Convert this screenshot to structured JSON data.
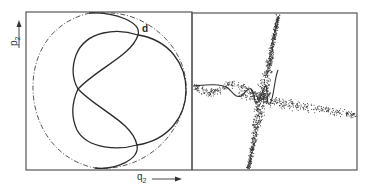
{
  "figure": {
    "left_panel": {
      "y_axis_label": "p",
      "y_axis_sub": "2",
      "x_axis_label": "q",
      "x_axis_sub": "2",
      "point_label": "d",
      "frame": {
        "x": 26,
        "y": 12,
        "w": 166,
        "h": 158
      },
      "boundary_circle": {
        "cx": 112,
        "cy": 89,
        "r": 77,
        "style": "dash-dot"
      },
      "curve_style": "solid"
    },
    "right_panel": {
      "frame": {
        "x": 192,
        "y": 13,
        "w": 165,
        "h": 157
      },
      "content": "scatter of points along chaotic trajectory"
    },
    "colors": {
      "ink": "#2a2a2a",
      "frame": "#555555",
      "background": "#ffffff"
    }
  }
}
